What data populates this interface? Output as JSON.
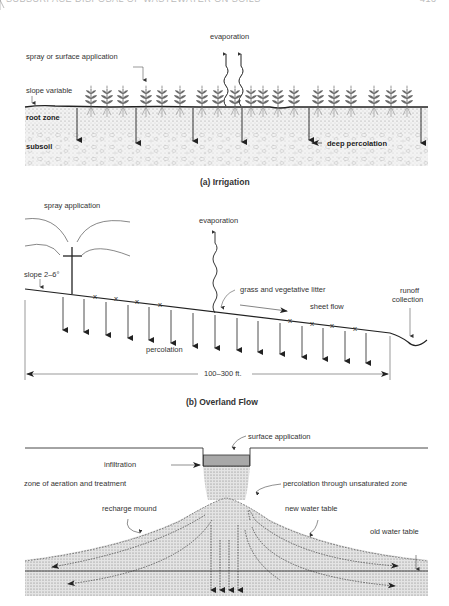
{
  "header": {
    "running_title": "SUBSURFACE DISPOSAL OF WASTEWATER ON SOILS",
    "page_number": "413"
  },
  "panels": [
    {
      "id": "a",
      "caption": "(a)  Irrigation",
      "labels": {
        "evaporation": "evaporation",
        "application": "spray or surface application",
        "slope": "slope variable",
        "root_zone": "root zone",
        "subsoil": "subsoil",
        "deep_percolation": "deep percolation"
      }
    },
    {
      "id": "b",
      "caption": "(b) Overland Flow",
      "labels": {
        "spray": "spray application",
        "evaporation": "evaporation",
        "slope": "slope 2–6°",
        "grass": "grass and vegetative litter",
        "sheet_flow": "sheet flow",
        "percolation": "percolation",
        "runoff": "runoff",
        "runoff2": "collection",
        "distance": "100–300 ft."
      }
    },
    {
      "id": "c",
      "caption": "",
      "labels": {
        "surface_application": "surface application",
        "infiltration": "infiltration",
        "zone": "zone of aeration and treatment",
        "percolation": "percolation through unsaturated zone",
        "recharge": "recharge mound",
        "new_wt": "new water table",
        "old_wt": "old water table"
      }
    }
  ],
  "colors": {
    "line": "#222222",
    "soil": "#d9d9d9",
    "pit": "#a8a8a8"
  }
}
